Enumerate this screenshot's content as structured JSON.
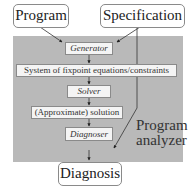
{
  "diagram": {
    "inputs": {
      "program": "Program",
      "specification": "Specification"
    },
    "analyzer": {
      "label_line1": "Program",
      "label_line2": "analyzer",
      "steps": [
        {
          "label": "Generator",
          "style": "italic"
        },
        {
          "label": "System of fixpoint equations/constraints",
          "style": "normal"
        },
        {
          "label": "Solver",
          "style": "italic"
        },
        {
          "label": "(Approximate) solution",
          "style": "normal"
        },
        {
          "label": "Diagnoser",
          "style": "italic"
        }
      ],
      "background_color": "#b9b9b9"
    },
    "output": {
      "diagnosis": "Diagnosis"
    },
    "edges": [
      {
        "from": "Program",
        "to": "Generator"
      },
      {
        "from": "Specification",
        "to": "Generator"
      },
      {
        "from": "Specification",
        "to": "Diagnoser"
      },
      {
        "from": "Generator",
        "to": "System of fixpoint equations/constraints"
      },
      {
        "from": "System of fixpoint equations/constraints",
        "to": "Solver"
      },
      {
        "from": "Solver",
        "to": "(Approximate) solution"
      },
      {
        "from": "(Approximate) solution",
        "to": "Diagnoser"
      },
      {
        "from": "Diagnoser",
        "to": "Diagnosis"
      }
    ]
  }
}
